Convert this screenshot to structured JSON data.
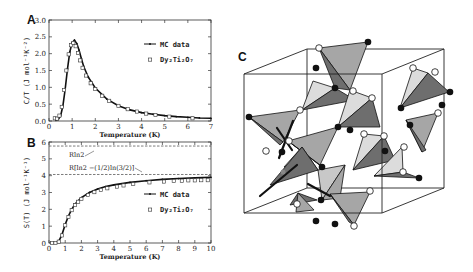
{
  "figure": {
    "panels": [
      "A",
      "B",
      "C"
    ]
  },
  "chart_data": [
    {
      "panel": "A",
      "type": "scatter",
      "title": "",
      "xlabel": "Temperature (K)",
      "ylabel": "C/T (J mol⁻¹K⁻²)",
      "xlim": [
        0,
        7
      ],
      "ylim": [
        0,
        3.0
      ],
      "xticks": [
        "0",
        "1",
        "2",
        "3",
        "4",
        "5",
        "6",
        "7"
      ],
      "yticks": [
        "0.0",
        "0.5",
        "1.0",
        "1.5",
        "2.0",
        "2.5",
        "3.0"
      ],
      "grid": false,
      "legend": {
        "position": "upper right",
        "entries": [
          "MC data",
          "Dy₂Ti₂O₇"
        ]
      },
      "series": [
        {
          "name": "MC data",
          "style": "line-with-dots",
          "x": [
            0.3,
            0.4,
            0.5,
            0.6,
            0.7,
            0.8,
            0.9,
            1.0,
            1.1,
            1.2,
            1.3,
            1.4,
            1.5,
            1.7,
            2.0,
            2.5,
            3.0,
            3.5,
            4.0,
            4.5,
            5.0,
            5.5,
            6.0,
            6.5,
            7.0
          ],
          "y": [
            0.02,
            0.05,
            0.15,
            0.45,
            0.95,
            1.55,
            2.05,
            2.33,
            2.4,
            2.3,
            2.1,
            1.85,
            1.62,
            1.3,
            0.98,
            0.65,
            0.45,
            0.33,
            0.25,
            0.2,
            0.16,
            0.13,
            0.11,
            0.09,
            0.08
          ]
        },
        {
          "name": "Dy₂Ti₂O₇",
          "style": "open-square",
          "x": [
            0.25,
            0.35,
            0.45,
            0.55,
            0.65,
            0.75,
            0.85,
            0.95,
            1.05,
            1.15,
            1.25,
            1.35,
            1.45,
            1.6,
            1.8,
            2.0,
            2.3,
            2.6,
            3.0,
            3.4,
            3.8,
            4.2,
            4.6,
            5.2,
            6.2
          ],
          "y": [
            0.08,
            0.07,
            0.16,
            0.42,
            0.92,
            1.5,
            1.98,
            2.25,
            2.32,
            2.22,
            2.02,
            1.8,
            1.58,
            1.35,
            1.12,
            0.95,
            0.75,
            0.6,
            0.45,
            0.35,
            0.28,
            0.22,
            0.18,
            0.13,
            0.08
          ]
        }
      ]
    },
    {
      "panel": "B",
      "type": "scatter",
      "title": "",
      "xlabel": "Temperature (K)",
      "ylabel": "S(T) (J mol⁻¹K⁻¹)",
      "xlim": [
        0,
        10
      ],
      "ylim": [
        0,
        6
      ],
      "xticks": [
        "0",
        "1",
        "2",
        "3",
        "4",
        "5",
        "6",
        "7",
        "8",
        "9",
        "10"
      ],
      "yticks": [
        "0",
        "1",
        "2",
        "3",
        "4",
        "5",
        "6"
      ],
      "grid": false,
      "legend": {
        "position": "center right",
        "entries": [
          "MC data",
          "Dy₂Ti₂O₇"
        ]
      },
      "reference_lines": [
        {
          "label": "Rln2",
          "y": 5.76,
          "style": "dashed"
        },
        {
          "label": "R[ln2 −(1/2)ln(3/2)]",
          "y": 4.07,
          "style": "dashed"
        }
      ],
      "series": [
        {
          "name": "MC data",
          "style": "line-with-dots",
          "x": [
            0.2,
            0.4,
            0.6,
            0.8,
            1.0,
            1.2,
            1.4,
            1.6,
            1.8,
            2.0,
            2.5,
            3.0,
            3.5,
            4.0,
            5.0,
            6.0,
            7.0,
            8.0,
            9.0,
            10.0
          ],
          "y": [
            0.0,
            0.0,
            0.1,
            0.5,
            1.1,
            1.6,
            2.0,
            2.3,
            2.5,
            2.7,
            3.0,
            3.2,
            3.35,
            3.45,
            3.6,
            3.7,
            3.78,
            3.83,
            3.87,
            3.9
          ]
        },
        {
          "name": "Dy₂Ti₂O₇",
          "style": "open-square",
          "x": [
            0.2,
            0.4,
            0.6,
            0.8,
            1.0,
            1.2,
            1.4,
            1.6,
            1.8,
            2.0,
            2.4,
            2.8,
            3.2,
            3.6,
            4.2,
            4.6,
            5.2,
            6.2,
            7.1,
            7.7,
            8.2,
            8.6,
            9.0,
            9.4,
            9.8
          ],
          "y": [
            0.0,
            0.0,
            0.08,
            0.45,
            1.05,
            1.55,
            1.95,
            2.25,
            2.45,
            2.62,
            2.85,
            3.02,
            3.15,
            3.25,
            3.35,
            3.42,
            3.5,
            3.6,
            3.65,
            3.68,
            3.7,
            3.72,
            3.72,
            3.73,
            3.73
          ]
        }
      ]
    }
  ],
  "panel_A": {
    "label": "A",
    "xlabel": "Temperature (K)",
    "ylabel": "C/T (J mol⁻¹K⁻²)",
    "legend": {
      "mc": "MC data",
      "exp": "Dy₂Ti₂O₇"
    }
  },
  "panel_B": {
    "label": "B",
    "xlabel": "Temperature (K)",
    "ylabel": "S(T) (J mol⁻¹K⁻¹)",
    "annotation_rln2": "Rln2",
    "annotation_pauling": "R[ln2 −(1/2)ln(3/2)]",
    "legend": {
      "mc": "MC data",
      "exp": "Dy₂Ti₂O₇"
    }
  },
  "panel_C": {
    "label": "C",
    "description": "pyrochlore lattice of corner-sharing tetrahedra in cubic unit cell with spins (open/filled circles)"
  }
}
